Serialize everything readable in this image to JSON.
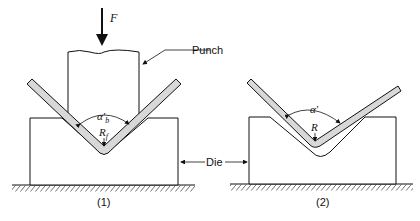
{
  "figure": {
    "labels": {
      "force": "F",
      "punch": "Punch",
      "die": "Die",
      "angle_1": "α′b",
      "angle_1_main": "α′",
      "angle_1_sub": "b",
      "radius_1": "R",
      "radius_1_sub": "f",
      "angle_2": "α′",
      "radius_2": "R",
      "caption_1": "(1)",
      "caption_2": "(2)"
    },
    "colors": {
      "line": "#111111",
      "sheet_fill": "#d8d8d8",
      "background": "#ffffff"
    }
  }
}
